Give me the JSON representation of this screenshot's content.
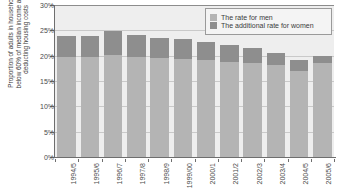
{
  "chart_data": {
    "type": "bar",
    "title": "",
    "subtitle": "",
    "xlabel": "",
    "ylabel_line1": "Proportion of adults in households",
    "ylabel_line2": "below 60% of median income after",
    "ylabel_line3": "deducting housing costs",
    "ylabel": "Proportion of adults in households below 60% of median income after deducting housing costs",
    "stacked": true,
    "grid": true,
    "legend_position": "top-right",
    "ylim": [
      0,
      30
    ],
    "ytick_labels": [
      "0%",
      "5%",
      "10%",
      "15%",
      "20%",
      "25%",
      "30%"
    ],
    "ytick_values": [
      0,
      5,
      10,
      15,
      20,
      25,
      30
    ],
    "categories": [
      "1994/5",
      "1995/6",
      "1996/7",
      "1997/8",
      "1998/9",
      "1999/00",
      "2000/1",
      "2001/2",
      "2002/3",
      "2003/4",
      "2004/5",
      "2005/6"
    ],
    "series": [
      {
        "name": "The rate for men",
        "color": "#b4b4b4",
        "values": [
          20.0,
          20.0,
          20.3,
          20.0,
          19.8,
          19.6,
          19.3,
          19.0,
          18.8,
          18.3,
          17.2,
          18.8
        ]
      },
      {
        "name": "The additional rate for women",
        "color": "#8e8e8e",
        "values": [
          4.0,
          4.0,
          4.7,
          4.3,
          3.9,
          3.8,
          3.6,
          3.3,
          3.0,
          2.4,
          2.2,
          1.4
        ]
      }
    ],
    "totals": [
      24.0,
      24.0,
      25.0,
      24.3,
      23.7,
      23.4,
      22.9,
      22.3,
      21.8,
      20.7,
      19.4,
      20.2
    ]
  },
  "legend": {
    "items": [
      {
        "label": "The rate for men",
        "color": "#b4b4b4"
      },
      {
        "label": "The additional rate for women",
        "color": "#8e8e8e"
      }
    ]
  },
  "colors": {
    "men": "#b4b4b4",
    "women": "#8e8e8e",
    "plot_bg": "#eeeeee",
    "gridline": "#c9c9c9",
    "axis": "#6e6e6e",
    "text": "#3b3b3b"
  }
}
